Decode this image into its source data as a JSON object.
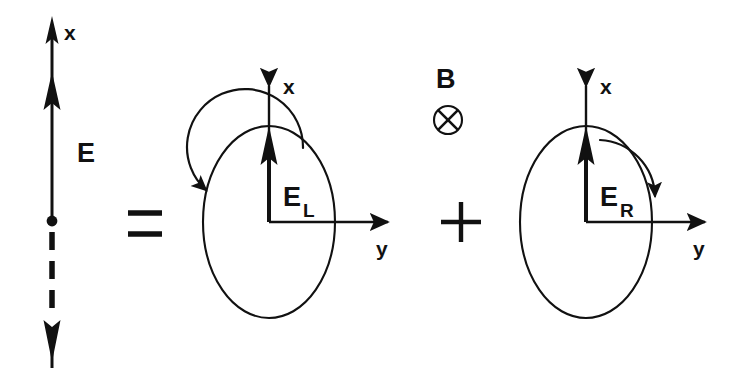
{
  "figure": {
    "background_color": "#ffffff",
    "ink_color": "#111111",
    "width": 752,
    "height": 376
  },
  "left_term": {
    "name": "linear-polarization",
    "axis_label_x": "x",
    "field_label": "E",
    "description": "Vertical double-ended vector with solid upper half and dashed lower half, origin dot at center",
    "origin_dot": true,
    "upper_style": "solid",
    "lower_style": "dashed"
  },
  "operators": {
    "equals": "=",
    "plus": "+"
  },
  "middle_term": {
    "name": "left-circular-polarization",
    "axis_label_x": "x",
    "axis_label_y": "y",
    "field_label": "E",
    "field_subscript": "L",
    "rotation_sense": "counterclockwise",
    "circle_radius": 47
  },
  "magnetic_field": {
    "name": "magnetic-field",
    "label": "B",
    "symbol_name": "circle-cross-into-page-icon",
    "direction": "into-page"
  },
  "right_term": {
    "name": "right-circular-polarization",
    "axis_label_x": "x",
    "axis_label_y": "y",
    "field_label": "E",
    "field_subscript": "R",
    "rotation_sense": "clockwise",
    "circle_radius": 47
  }
}
